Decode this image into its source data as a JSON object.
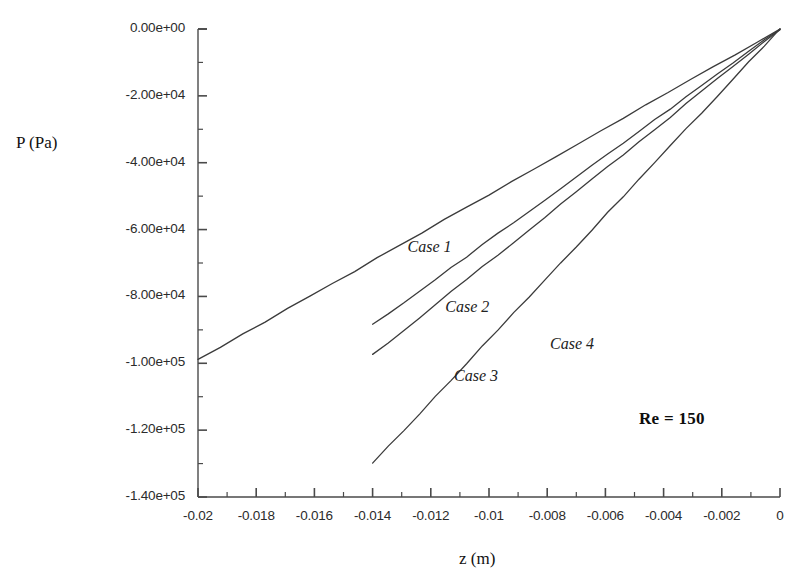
{
  "chart_data": {
    "type": "line",
    "title": "",
    "xlabel": "z (m)",
    "ylabel": "P (Pa)",
    "xlim": [
      -0.02,
      0
    ],
    "ylim": [
      -140000,
      0
    ],
    "grid": false,
    "legend_position": "inline-annotations",
    "x_ticks": [
      "-0.02",
      "-0.018",
      "-0.016",
      "-0.014",
      "-0.012",
      "-0.01",
      "-0.008",
      "-0.006",
      "-0.004",
      "-0.002",
      "0"
    ],
    "x_tick_values": [
      -0.02,
      -0.018,
      -0.016,
      -0.014,
      -0.012,
      -0.01,
      -0.008,
      -0.006,
      -0.004,
      -0.002,
      0
    ],
    "y_ticks": [
      "0.00e+00",
      "-2.00e+04",
      "-4.00e+04",
      "-6.00e+04",
      "-8.00e+04",
      "-1.00e+05",
      "-1.20e+05",
      "-1.40e+05"
    ],
    "y_tick_values": [
      0,
      -20000,
      -40000,
      -60000,
      -80000,
      -100000,
      -120000,
      -140000
    ],
    "annotations": [
      {
        "text": "Re = 150",
        "x": -0.0048,
        "y": -117000,
        "style": "bold"
      }
    ],
    "series": [
      {
        "name": "Case 1",
        "label": "Case 1",
        "color": "#3b3b3b",
        "x": [
          -0.02,
          0
        ],
        "values": [
          -99000,
          0
        ],
        "label_x": -0.0128,
        "label_y": -65500
      },
      {
        "name": "Case 2",
        "label": "Case 2",
        "color": "#3b3b3b",
        "x": [
          -0.014,
          0
        ],
        "values": [
          -88500,
          0
        ],
        "label_x": -0.0115,
        "label_y": -83500
      },
      {
        "name": "Case 3",
        "label": "Case 3",
        "color": "#3b3b3b",
        "x": [
          -0.014,
          0
        ],
        "values": [
          -97500,
          0
        ],
        "label_x": -0.0112,
        "label_y": -104000
      },
      {
        "name": "Case 4",
        "label": "Case 4",
        "color": "#3b3b3b",
        "x": [
          -0.014,
          0
        ],
        "values": [
          -130000,
          0
        ],
        "label_x": -0.0079,
        "label_y": -94500
      }
    ]
  },
  "axes": {
    "plot_left_px": 198,
    "plot_right_px": 780,
    "plot_top_px": 29,
    "plot_bottom_px": 497,
    "axis_color": "#4a4a4a"
  }
}
